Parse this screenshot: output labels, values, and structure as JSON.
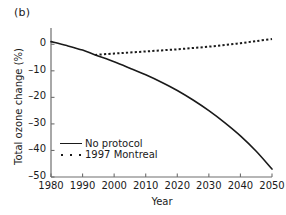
{
  "figure": {
    "panel_label": "(b)"
  },
  "chart_data": {
    "type": "line",
    "title": "",
    "subtitle": "",
    "panel": "(b)",
    "xlabel": "Year",
    "ylabel": "Total ozone change (%)",
    "xlim": [
      1980,
      2050
    ],
    "ylim": [
      -50,
      5
    ],
    "xticks": [
      1980,
      1990,
      2000,
      2010,
      2020,
      2030,
      2040,
      2050
    ],
    "yticks": [
      0,
      -10,
      -20,
      -30,
      -40,
      -50
    ],
    "xtick_labels": [
      "1980",
      "1990",
      "2000",
      "2010",
      "2020",
      "2030",
      "2040",
      "2050"
    ],
    "ytick_labels": [
      "0",
      "-10",
      "-20",
      "-30",
      "-40",
      "-50"
    ],
    "grid": false,
    "legend_position": "lower-left-inside",
    "x": [
      1980,
      1985,
      1990,
      1994,
      2000,
      2005,
      2010,
      2015,
      2020,
      2025,
      2030,
      2035,
      2040,
      2045,
      2050
    ],
    "series": [
      {
        "name": "No protocol",
        "style": "solid",
        "color": "#1a1a1a",
        "values": [
          1.0,
          -0.5,
          -2.2,
          -4.0,
          -6.6,
          -9.0,
          -11.5,
          -14.3,
          -17.4,
          -21.0,
          -25.0,
          -29.5,
          -34.5,
          -40.3,
          -47.0
        ]
      },
      {
        "name": "1997 Montreal",
        "style": "dotted",
        "color": "#1a1a1a",
        "values": [
          null,
          null,
          null,
          -4.0,
          -3.5,
          -3.1,
          -2.7,
          -2.3,
          -1.9,
          -1.4,
          -0.9,
          -0.3,
          0.4,
          1.2,
          2.0
        ]
      }
    ],
    "legend": [
      "No protocol",
      "1997 Montreal"
    ],
    "annotations": []
  },
  "legend": {
    "items": [
      {
        "label": "No protocol",
        "style": "solid"
      },
      {
        "label": "1997 Montreal",
        "style": "dotted"
      }
    ]
  }
}
